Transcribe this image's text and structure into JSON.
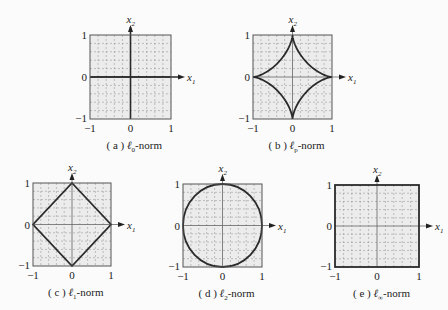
{
  "figure": {
    "panels": [
      {
        "id": "a",
        "label": "( a )",
        "norm_symbol": "ℓ",
        "norm_sub": "0",
        "norm_suffix": "-norm",
        "shape": "axes",
        "box": {
          "x": 90,
          "y": 35,
          "w": 81,
          "h": 84
        }
      },
      {
        "id": "b",
        "label": "( b )",
        "norm_symbol": "ℓ",
        "norm_sub": "p",
        "norm_suffix": "-norm",
        "shape": "astroid",
        "box": {
          "x": 253,
          "y": 35,
          "w": 79,
          "h": 84
        }
      },
      {
        "id": "c",
        "label": "( c )",
        "norm_symbol": "ℓ",
        "norm_sub": "1",
        "norm_suffix": "-norm",
        "shape": "diamond",
        "box": {
          "x": 33,
          "y": 183,
          "w": 78,
          "h": 83
        }
      },
      {
        "id": "d",
        "label": "( d )",
        "norm_symbol": "ℓ",
        "norm_sub": "2",
        "norm_suffix": "-norm",
        "shape": "circle",
        "box": {
          "x": 183,
          "y": 184,
          "w": 79,
          "h": 83
        }
      },
      {
        "id": "e",
        "label": "( e )",
        "norm_symbol": "ℓ",
        "norm_sub": "∞",
        "norm_suffix": "-norm",
        "shape": "square",
        "box": {
          "x": 335,
          "y": 185,
          "w": 84,
          "h": 82
        }
      }
    ],
    "axis_labels": {
      "x": "x",
      "x_sub": "1",
      "y": "x",
      "y_sub": "2"
    },
    "ticks": {
      "neg": "−1",
      "zero": "0",
      "pos": "1"
    },
    "colors": {
      "curve": "#2a2a2a",
      "box": "#555555",
      "grid": "#9a9a9a",
      "fill": "#ececec"
    }
  },
  "chart_data": [
    {
      "type": "diagram",
      "title": "( a ) ℓ0-norm",
      "xlabel": "x1",
      "ylabel": "x2",
      "xlim": [
        -1,
        1
      ],
      "ylim": [
        -1,
        1
      ],
      "grid": true,
      "unit_ball": "coordinate axes (cross)"
    },
    {
      "type": "diagram",
      "title": "( b ) ℓp-norm",
      "xlabel": "x1",
      "ylabel": "x2",
      "xlim": [
        -1,
        1
      ],
      "ylim": [
        -1,
        1
      ],
      "grid": true,
      "unit_ball": "astroid (p<1), vertices at (±1,0),(0,±1)"
    },
    {
      "type": "diagram",
      "title": "( c ) ℓ1-norm",
      "xlabel": "x1",
      "ylabel": "x2",
      "xlim": [
        -1,
        1
      ],
      "ylim": [
        -1,
        1
      ],
      "grid": true,
      "unit_ball": "diamond, vertices at (±1,0),(0,±1)"
    },
    {
      "type": "diagram",
      "title": "( d ) ℓ2-norm",
      "xlabel": "x1",
      "ylabel": "x2",
      "xlim": [
        -1,
        1
      ],
      "ylim": [
        -1,
        1
      ],
      "grid": true,
      "unit_ball": "circle radius 1"
    },
    {
      "type": "diagram",
      "title": "( e ) ℓ∞-norm",
      "xlabel": "x1",
      "ylabel": "x2",
      "xlim": [
        -1,
        1
      ],
      "ylim": [
        -1,
        1
      ],
      "grid": true,
      "unit_ball": "square [-1,1]x[-1,1]"
    }
  ]
}
